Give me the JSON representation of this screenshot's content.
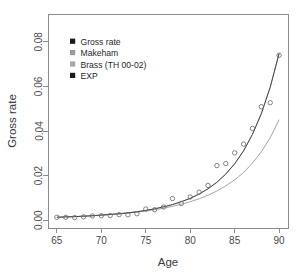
{
  "chart_data": {
    "type": "scatter",
    "title": "",
    "xlabel": "Age",
    "ylabel": "Gross rate",
    "xlim": [
      64.0,
      91.0
    ],
    "ylim": [
      -0.0035,
      0.0925
    ],
    "xticks": [
      65,
      70,
      75,
      80,
      85,
      90
    ],
    "xticklabels": [
      "65",
      "70",
      "75",
      "80",
      "85",
      "90"
    ],
    "yticks": [
      0.0,
      0.02,
      0.04,
      0.06,
      0.08
    ],
    "yticklabels": [
      "0.00",
      "0.02",
      "0.04",
      "0.06",
      "0.08"
    ],
    "grid": false,
    "legend_position": "top-left",
    "box": true,
    "x": [
      65,
      66,
      67,
      68,
      69,
      70,
      71,
      72,
      73,
      74,
      75,
      76,
      77,
      78,
      79,
      80,
      81,
      82,
      83,
      84,
      85,
      86,
      87,
      88,
      89,
      90
    ],
    "series": [
      {
        "name": "Gross rate",
        "marker": "open-circle",
        "color": "#6e6e6e",
        "style": "points",
        "values": [
          0.0013,
          0.0013,
          0.0012,
          0.0015,
          0.0019,
          0.002,
          0.0021,
          0.0025,
          0.0024,
          0.0029,
          0.005,
          0.0047,
          0.0059,
          0.0097,
          0.0075,
          0.0104,
          0.0126,
          0.0156,
          0.0245,
          0.0254,
          0.0302,
          0.0341,
          0.0412,
          0.0509,
          0.0527,
          0.074
        ]
      },
      {
        "name": "Makeham",
        "marker": "square",
        "color": "#9a9a9a",
        "style": "line",
        "values": [
          0.0013,
          0.0015,
          0.0016,
          0.0018,
          0.002,
          0.0022,
          0.0025,
          0.0028,
          0.0032,
          0.0036,
          0.0041,
          0.0047,
          0.0054,
          0.0062,
          0.0072,
          0.0083,
          0.0096,
          0.0112,
          0.0131,
          0.0154,
          0.0181,
          0.0214,
          0.0256,
          0.0307,
          0.037,
          0.0451
        ]
      },
      {
        "name": "Brass (TH 00-02)",
        "marker": "square",
        "color": "#a8a8a8",
        "style": "line",
        "values": [
          0.0013,
          0.0015,
          0.0016,
          0.0018,
          0.002,
          0.0023,
          0.0026,
          0.0029,
          0.0033,
          0.0038,
          0.0044,
          0.0051,
          0.006,
          0.007,
          0.0083,
          0.0098,
          0.0117,
          0.0141,
          0.017,
          0.0207,
          0.0253,
          0.0311,
          0.0385,
          0.0478,
          0.0597,
          0.0748
        ]
      },
      {
        "name": "EXP",
        "marker": "square",
        "color": "#3a3a3a",
        "style": "line",
        "values": [
          0.0013,
          0.0015,
          0.0016,
          0.0018,
          0.002,
          0.0023,
          0.0026,
          0.0029,
          0.0033,
          0.0038,
          0.0044,
          0.0051,
          0.006,
          0.007,
          0.0083,
          0.0098,
          0.0117,
          0.0141,
          0.017,
          0.0207,
          0.0253,
          0.0311,
          0.0385,
          0.0478,
          0.0597,
          0.0748
        ]
      }
    ],
    "legend": [
      {
        "label": "Gross rate",
        "color": "#1a1a1a"
      },
      {
        "label": "Makeham",
        "color": "#9a9a9a"
      },
      {
        "label": "Brass (TH 00-02)",
        "color": "#a8a8a8"
      },
      {
        "label": "EXP",
        "color": "#1a1a1a"
      }
    ]
  }
}
